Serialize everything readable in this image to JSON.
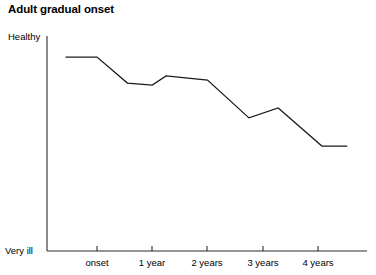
{
  "chart_data": {
    "type": "line",
    "title": "Adult gradual onset",
    "xlabel": "",
    "ylabel": "",
    "grid": false,
    "legend": null,
    "y_axis": {
      "top_label": "Healthy",
      "bottom_label": "Very ill",
      "qualitative": true,
      "ylim": [
        0,
        100
      ]
    },
    "x_axis": {
      "tick_labels": [
        "onset",
        "1 year",
        "2 years",
        "3 years",
        "4 years"
      ],
      "tick_values": [
        0,
        1,
        2,
        3,
        4
      ],
      "xlim": [
        -0.6,
        5.0
      ]
    },
    "series": [
      {
        "name": "health status",
        "x": [
          -0.57,
          0.0,
          0.55,
          1.0,
          1.25,
          2.0,
          2.75,
          3.28,
          4.07,
          4.53
        ],
        "y": [
          90.2,
          90.2,
          78.1,
          77.2,
          81.4,
          79.5,
          61.9,
          66.5,
          48.8,
          48.8
        ],
        "color": "#1a1a1a"
      }
    ],
    "annotations": []
  },
  "style": {
    "axis_color": "#2b2b2b",
    "line_color": "#1a1a1a",
    "background": "#ffffff"
  }
}
